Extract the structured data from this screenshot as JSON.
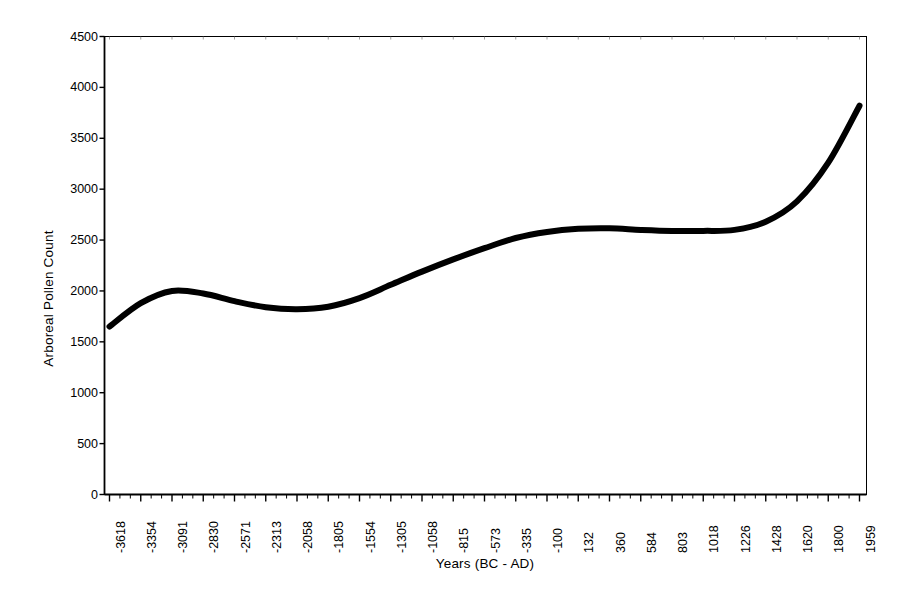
{
  "chart_data": {
    "type": "line",
    "title": "",
    "xlabel": "Years (BC - AD)",
    "ylabel": "Arboreal Pollen Count",
    "ylim": [
      0,
      4500
    ],
    "y_ticks": [
      0,
      500,
      1000,
      1500,
      2000,
      2500,
      3000,
      3500,
      4000,
      4500
    ],
    "y_tick_labels": [
      "0",
      "500",
      "1000",
      "1500",
      "2000",
      "2500",
      "3000",
      "3500",
      "4000",
      "4500"
    ],
    "grid": false,
    "legend": "none",
    "categories": [
      "-3618",
      "-3354",
      "-3091",
      "-2830",
      "-2571",
      "-2313",
      "-2058",
      "-1805",
      "-1554",
      "-1305",
      "-1058",
      "-815",
      "-573",
      "-335",
      "-100",
      "132",
      "360",
      "584",
      "803",
      "1018",
      "1226",
      "1428",
      "1620",
      "1800",
      "1959"
    ],
    "values": [
      1650,
      1880,
      2000,
      1975,
      1900,
      1840,
      1820,
      1845,
      1930,
      2060,
      2190,
      2310,
      2420,
      2520,
      2580,
      2610,
      2615,
      2600,
      2590,
      2590,
      2600,
      2680,
      2880,
      3260,
      3820
    ],
    "series_name": "Arboreal Pollen Count",
    "line_color": "#000000",
    "line_width": 6,
    "axis_color": "#000000",
    "background": "#ffffff"
  },
  "axes": {
    "x_title": "Years (BC - AD)",
    "y_title": "Arboreal Pollen Count"
  }
}
